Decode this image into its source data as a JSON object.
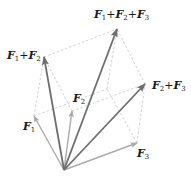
{
  "diagram": {
    "origin": [
      64,
      170
    ],
    "colors": {
      "basis": "#aaaaaa",
      "sum": "#6e6e6e",
      "dashed": "#cccccc"
    },
    "vectors": [
      {
        "id": "F1",
        "tip": [
          34,
          116
        ],
        "kind": "basis"
      },
      {
        "id": "F2",
        "tip": [
          72,
          111
        ],
        "kind": "basis"
      },
      {
        "id": "F3",
        "tip": [
          137,
          143
        ],
        "kind": "basis"
      },
      {
        "id": "F1+F2",
        "tip": [
          44,
          57
        ],
        "kind": "sum"
      },
      {
        "id": "F2+F3",
        "tip": [
          145,
          84
        ],
        "kind": "sum"
      },
      {
        "id": "F1+F2+F3",
        "tip": [
          117,
          29
        ],
        "kind": "sum"
      }
    ],
    "labels": {
      "F1": {
        "parts": [
          "F",
          "1"
        ]
      },
      "F2": {
        "parts": [
          "F",
          "2"
        ]
      },
      "F3": {
        "parts": [
          "F",
          "3"
        ]
      },
      "F1F2": {
        "parts": [
          "F",
          "1",
          "+",
          "F",
          "2"
        ]
      },
      "F2F3": {
        "parts": [
          "F",
          "2",
          "+",
          "F",
          "3"
        ]
      },
      "F1F2F3": {
        "parts": [
          "F",
          "1",
          "+",
          "F",
          "2",
          "+",
          "F",
          "3"
        ]
      }
    }
  }
}
